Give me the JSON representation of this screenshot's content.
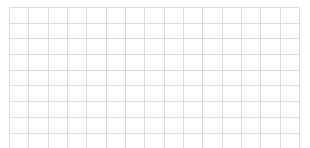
{
  "document": {
    "type": "empty-grid",
    "background_color": "#ffffff",
    "grid_line_color": "#dcdcdc",
    "columns": 15,
    "rows": 9,
    "cell_width_px": 19.4,
    "cell_height_px": 14.7,
    "origin_x_px": 9,
    "origin_y_px": 7,
    "width_px": 291,
    "height_px": 133
  },
  "rows": [
    {
      "cells": [
        "",
        "",
        "",
        "",
        "",
        "",
        "",
        "",
        "",
        "",
        "",
        "",
        "",
        "",
        ""
      ]
    },
    {
      "cells": [
        "",
        "",
        "",
        "",
        "",
        "",
        "",
        "",
        "",
        "",
        "",
        "",
        "",
        "",
        ""
      ]
    },
    {
      "cells": [
        "",
        "",
        "",
        "",
        "",
        "",
        "",
        "",
        "",
        "",
        "",
        "",
        "",
        "",
        ""
      ]
    },
    {
      "cells": [
        "",
        "",
        "",
        "",
        "",
        "",
        "",
        "",
        "",
        "",
        "",
        "",
        "",
        "",
        ""
      ]
    },
    {
      "cells": [
        "",
        "",
        "",
        "",
        "",
        "",
        "",
        "",
        "",
        "",
        "",
        "",
        "",
        "",
        ""
      ]
    },
    {
      "cells": [
        "",
        "",
        "",
        "",
        "",
        "",
        "",
        "",
        "",
        "",
        "",
        "",
        "",
        "",
        ""
      ]
    },
    {
      "cells": [
        "",
        "",
        "",
        "",
        "",
        "",
        "",
        "",
        "",
        "",
        "",
        "",
        "",
        "",
        ""
      ]
    },
    {
      "cells": [
        "",
        "",
        "",
        "",
        "",
        "",
        "",
        "",
        "",
        "",
        "",
        "",
        "",
        "",
        ""
      ]
    },
    {
      "cells": [
        "",
        "",
        "",
        "",
        "",
        "",
        "",
        "",
        "",
        "",
        "",
        "",
        "",
        "",
        ""
      ]
    }
  ]
}
